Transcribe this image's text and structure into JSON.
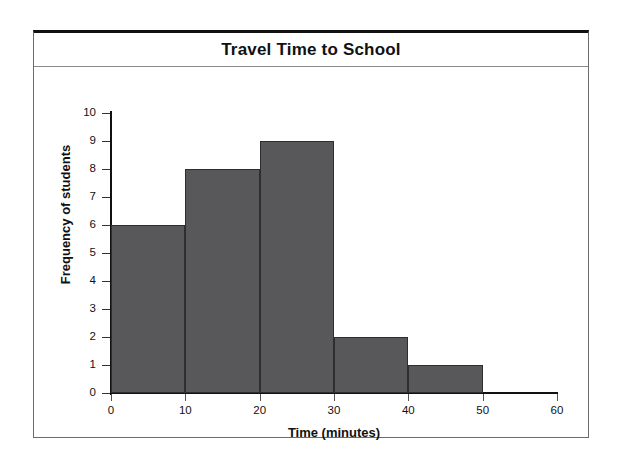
{
  "figure": {
    "title": "Travel Time to School",
    "bar_color": "#58585a",
    "bar_outline_color": "#2e2e30",
    "frame_color": "#6b6b6b",
    "axis_color": "#111111"
  },
  "chart_data": {
    "type": "bar",
    "title": "Travel Time to School",
    "xlabel": "Time (minutes)",
    "ylabel": "Frequency of students",
    "categories": [
      "0-10",
      "10-20",
      "20-30",
      "30-40",
      "40-50",
      "50-60"
    ],
    "bin_edges": [
      0,
      10,
      20,
      30,
      40,
      50,
      60
    ],
    "values": [
      6,
      8,
      9,
      2,
      1,
      0
    ],
    "xlim": [
      0,
      60
    ],
    "ylim": [
      0,
      10
    ],
    "x_ticks": [
      0,
      10,
      20,
      30,
      40,
      50,
      60
    ],
    "x_tick_labels": [
      "0",
      "10",
      "20",
      "30",
      "40",
      "50",
      "60"
    ],
    "y_ticks": [
      0,
      1,
      2,
      3,
      4,
      5,
      6,
      7,
      8,
      9,
      10
    ],
    "y_tick_labels": [
      "0",
      "1",
      "2",
      "3",
      "4",
      "5",
      "6",
      "7",
      "8",
      "9",
      "10"
    ],
    "grid": false,
    "legend": null
  }
}
